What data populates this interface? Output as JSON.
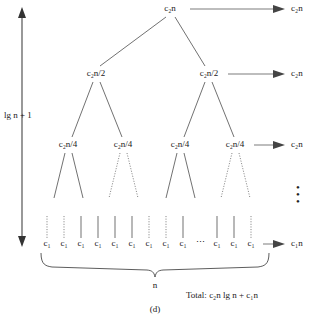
{
  "figure": {
    "caption": "(d)",
    "type": "recursion-tree"
  },
  "height_annotation": {
    "label": "lg n + 1",
    "label_parts": {
      "lead": "lg",
      "var": "n",
      "tail": "+ 1"
    }
  },
  "levels": [
    {
      "index": 0,
      "nodes": [
        {
          "text": "c₂n",
          "x": 170
        }
      ],
      "right_label": "c₂n",
      "has_right_arrow": true,
      "y": 10
    },
    {
      "index": 1,
      "nodes": [
        {
          "text": "c₂n/2",
          "x": 96
        },
        {
          "text": "c₂n/2",
          "x": 209
        }
      ],
      "right_label": "c₂n",
      "has_right_arrow": true,
      "y": 75
    },
    {
      "index": 2,
      "nodes": [
        {
          "text": "c₂n/4",
          "x": 68
        },
        {
          "text": "c₂n/4",
          "x": 123
        },
        {
          "text": "c₂n/4",
          "x": 180
        },
        {
          "text": "c₂n/4",
          "x": 235
        }
      ],
      "right_label": "c₂n",
      "has_right_arrow": true,
      "y": 146
    },
    {
      "index": 3,
      "nodes": [
        {
          "text": "c₁",
          "x": 47
        },
        {
          "text": "c₁",
          "x": 64
        },
        {
          "text": "c₁",
          "x": 81
        },
        {
          "text": "c₁",
          "x": 98
        },
        {
          "text": "c₁",
          "x": 115
        },
        {
          "text": "c₁",
          "x": 132
        },
        {
          "text": "c₁",
          "x": 149
        },
        {
          "text": "c₁",
          "x": 166
        },
        {
          "text": "c₁",
          "x": 183
        },
        {
          "text": "⋯",
          "x": 200
        },
        {
          "text": "c₁",
          "x": 217
        },
        {
          "text": "c₁",
          "x": 234
        },
        {
          "text": "c₁",
          "x": 251
        }
      ],
      "right_label": "c₁n",
      "has_right_arrow": true,
      "y": 245
    }
  ],
  "vertical_dots": "⋮",
  "leaf_brace": {
    "label": "n"
  },
  "total": {
    "prefix": "Total:",
    "expression": "c₂n lg n + c₁n"
  },
  "colors": {
    "ink": "#1a1a1a",
    "line": "#333333",
    "background": "#ffffff"
  }
}
